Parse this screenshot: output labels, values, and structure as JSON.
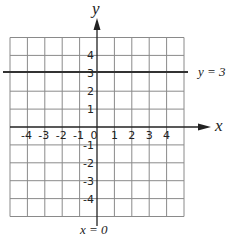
{
  "diagram": {
    "title": "",
    "axes": {
      "x_label": "x",
      "y_label": "y",
      "x_range": [
        -5,
        5
      ],
      "y_range": [
        -5,
        5
      ],
      "x_ticks": [
        "-4",
        "-3",
        "-2",
        "-1",
        "0",
        "1",
        "2",
        "3",
        "4"
      ],
      "y_ticks": [
        "4",
        "3",
        "2",
        "1",
        "-1",
        "-2",
        "-3",
        "-4"
      ]
    },
    "lines": [
      {
        "label": "y = 3",
        "equation": "y = 3",
        "orientation": "horizontal",
        "value": 3
      },
      {
        "label": "x = 0",
        "equation": "x = 0",
        "orientation": "vertical",
        "value": 0
      }
    ],
    "colors": {
      "grid": "#8a8a8a",
      "axis": "#222222",
      "line": "#333333"
    }
  }
}
